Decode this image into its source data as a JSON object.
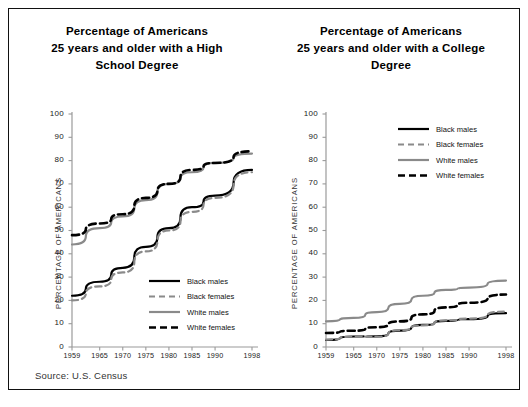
{
  "figure": {
    "source_note": "Source: U.S. Census",
    "border_color": "#111111",
    "background": "#ffffff"
  },
  "series_styles": {
    "black_males": {
      "color": "#000000",
      "dash": "none",
      "width": 2.2
    },
    "black_females": {
      "color": "#8a8a8a",
      "dash": "6,4",
      "width": 2.2
    },
    "white_males": {
      "color": "#8a8a8a",
      "dash": "none",
      "width": 2.2
    },
    "white_females": {
      "color": "#000000",
      "dash": "7,4",
      "width": 2.6
    }
  },
  "legend": {
    "entries": [
      {
        "label": "Black males",
        "key": "black_males"
      },
      {
        "label": "Black females",
        "key": "black_females"
      },
      {
        "label": "White males",
        "key": "white_males"
      },
      {
        "label": "White females",
        "key": "white_females"
      }
    ]
  },
  "panels": [
    {
      "id": "high-school",
      "title_lines": [
        "Percentage of Americans",
        "25 years and older with a High",
        "School Degree"
      ],
      "title_full": "Percentage of Americans 25 years and older with a High School Degree",
      "legend_position": "bottom-right"
    },
    {
      "id": "college",
      "title_lines": [
        "Percentage of Americans",
        "25 years and older with a College",
        "Degree"
      ],
      "title_full": "Percentage of Americans 25 years and older with a College Degree",
      "legend_position": "top-right"
    }
  ],
  "chart_data": [
    {
      "type": "line",
      "title": "Percentage of Americans 25 years and older with a High School Degree",
      "xlabel": "",
      "ylabel": "PERCENTAGE OF AMERICANS",
      "x": [
        1959,
        1965,
        1970,
        1975,
        1980,
        1985,
        1990,
        1998
      ],
      "xticklabels": [
        "1959",
        "1965",
        "1970",
        "1975",
        "1980",
        "1985",
        "1990",
        "1998"
      ],
      "yticks": [
        0,
        10,
        20,
        30,
        40,
        50,
        60,
        70,
        80,
        90,
        100
      ],
      "ylim": [
        0,
        100
      ],
      "grid": false,
      "legend_position": "lower right",
      "series": [
        {
          "name": "Black males",
          "values": [
            22,
            28,
            34,
            43,
            51,
            60,
            65,
            76
          ]
        },
        {
          "name": "Black females",
          "values": [
            20,
            26,
            32,
            41,
            50,
            58,
            64,
            75
          ]
        },
        {
          "name": "White males",
          "values": [
            44,
            51,
            56,
            63,
            70,
            75,
            79,
            83
          ]
        },
        {
          "name": "White females",
          "values": [
            48,
            53,
            57,
            64,
            70,
            76,
            79,
            84
          ]
        }
      ]
    },
    {
      "type": "line",
      "title": "Percentage of Americans 25 years and older with a College Degree",
      "xlabel": "",
      "ylabel": "PERCENTAGE OF AMERICANS",
      "x": [
        1959,
        1965,
        1970,
        1975,
        1980,
        1985,
        1990,
        1998
      ],
      "xticklabels": [
        "1959",
        "1965",
        "1970",
        "1975",
        "1980",
        "1985",
        "1990",
        "1998"
      ],
      "yticks": [
        0,
        10,
        20,
        30,
        40,
        50,
        60,
        70,
        80,
        90,
        100
      ],
      "ylim": [
        0,
        100
      ],
      "grid": false,
      "legend_position": "upper right",
      "series": [
        {
          "name": "Black males",
          "values": [
            3.0,
            4.5,
            4.6,
            7.0,
            9.5,
            11.2,
            12.0,
            14.5
          ]
        },
        {
          "name": "Black females",
          "values": [
            3.2,
            4.4,
            4.4,
            7.2,
            9.3,
            11.4,
            12.2,
            15.2
          ]
        },
        {
          "name": "White males",
          "values": [
            11.0,
            12.5,
            15.0,
            18.5,
            22.0,
            24.5,
            25.5,
            28.5
          ]
        },
        {
          "name": "White females",
          "values": [
            6.0,
            7.0,
            8.5,
            11.0,
            14.0,
            17.0,
            19.0,
            22.5
          ]
        }
      ]
    }
  ]
}
